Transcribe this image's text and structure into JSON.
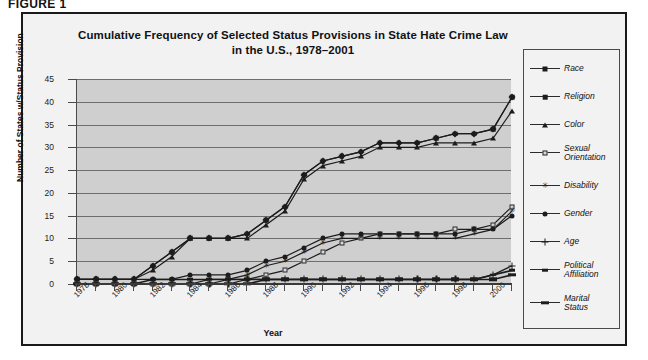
{
  "figure_label": "FIGURE 1",
  "chart_data": {
    "type": "line",
    "title": "Cumulative Frequency of Selected Status Provisions in State Hate Crime Law in the U.S., 1978–2001",
    "title_line1": "Cumulative Frequency of Selected Status Provisions in State Hate Crime Law",
    "title_line2": "in the U.S., 1978–2001",
    "xlabel": "Year",
    "ylabel": "Number of States w/Status Provision",
    "grid": true,
    "legend_position": "right",
    "ylim": [
      0,
      45
    ],
    "yticks": [
      0,
      5,
      10,
      15,
      20,
      25,
      30,
      35,
      40,
      45
    ],
    "xlim": [
      1978,
      2001
    ],
    "x": [
      1978,
      1979,
      1980,
      1981,
      1982,
      1983,
      1984,
      1985,
      1986,
      1987,
      1988,
      1989,
      1990,
      1991,
      1992,
      1993,
      1994,
      1995,
      1996,
      1997,
      1998,
      1999,
      2000,
      2001
    ],
    "xtick_labels": [
      "1978",
      "1980",
      "1982",
      "1984",
      "1986",
      "1988",
      "1990",
      "1992",
      "1994",
      "1996",
      "1998",
      "2000"
    ],
    "xtick_years": [
      1978,
      1980,
      1982,
      1984,
      1986,
      1988,
      1990,
      1992,
      1994,
      1996,
      1998,
      2000
    ],
    "series": [
      {
        "name": "Race",
        "marker": "diamond",
        "values": [
          1,
          1,
          1,
          1,
          4,
          7,
          10,
          10,
          10,
          11,
          14,
          17,
          24,
          27,
          28,
          29,
          31,
          31,
          31,
          32,
          33,
          33,
          34,
          41
        ]
      },
      {
        "name": "Religion",
        "marker": "square",
        "values": [
          1,
          1,
          1,
          1,
          4,
          7,
          10,
          10,
          10,
          11,
          14,
          17,
          24,
          27,
          28,
          29,
          31,
          31,
          31,
          32,
          33,
          33,
          34,
          41
        ]
      },
      {
        "name": "Color",
        "marker": "triangle",
        "values": [
          1,
          1,
          1,
          1,
          3,
          6,
          10,
          10,
          10,
          10,
          13,
          16,
          23,
          26,
          27,
          28,
          30,
          30,
          30,
          31,
          31,
          31,
          32,
          38
        ]
      },
      {
        "name": "Sexual Orientation",
        "marker": "open-square",
        "values": [
          0,
          0,
          0,
          0,
          0,
          0,
          0,
          0,
          1,
          1,
          2,
          3,
          5,
          7,
          9,
          10,
          11,
          11,
          11,
          11,
          12,
          12,
          13,
          17
        ]
      },
      {
        "name": "Disability",
        "marker": "star",
        "values": [
          0,
          0,
          0,
          0,
          0,
          0,
          0,
          1,
          1,
          2,
          4,
          5,
          7,
          9,
          10,
          10,
          10,
          10,
          10,
          10,
          10,
          11,
          12,
          16
        ]
      },
      {
        "name": "Gender",
        "marker": "circle",
        "values": [
          1,
          1,
          1,
          1,
          1,
          1,
          2,
          2,
          2,
          3,
          5,
          6,
          8,
          10,
          11,
          11,
          11,
          11,
          11,
          11,
          11,
          12,
          12,
          15
        ]
      },
      {
        "name": "Age",
        "marker": "plus",
        "values": [
          0,
          0,
          0,
          0,
          0,
          0,
          0,
          0,
          0,
          1,
          1,
          1,
          1,
          1,
          1,
          1,
          1,
          1,
          1,
          1,
          1,
          1,
          2,
          4
        ]
      },
      {
        "name": "Political Affiliation",
        "marker": "dash",
        "values": [
          0,
          0,
          0,
          0,
          1,
          1,
          1,
          1,
          1,
          1,
          1,
          1,
          1,
          1,
          1,
          1,
          1,
          1,
          1,
          1,
          1,
          1,
          2,
          3
        ]
      },
      {
        "name": "Marital Status",
        "marker": "bar",
        "values": [
          0,
          0,
          0,
          0,
          0,
          0,
          0,
          0,
          0,
          0,
          1,
          1,
          1,
          1,
          1,
          1,
          1,
          1,
          1,
          1,
          1,
          1,
          1,
          2
        ]
      }
    ]
  },
  "colors": {
    "plot_background": "#cfcfcf",
    "figure_background": "#f2f2f2",
    "line": "#1c1c1c",
    "grid": "#6e6e6e",
    "frame": "#1a1a1a"
  }
}
